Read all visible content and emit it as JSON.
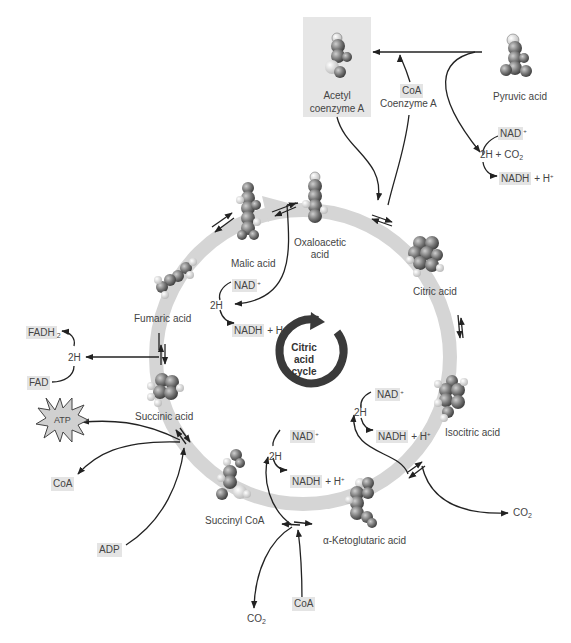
{
  "title": "Citric acid cycle",
  "colors": {
    "ring": "#d5d5d5",
    "center_ring": "#3a3a3a",
    "chip_bg": "#e4e4e4",
    "acetyl_box": "#e6e6e6",
    "arrow": "#222222",
    "text": "#444444"
  },
  "center": {
    "line1": "Citric",
    "line2": "acid",
    "line3": "cycle"
  },
  "molecules": {
    "pyruvic": "Pyruvic acid",
    "acetyl_l1": "Acetyl",
    "acetyl_l2": "coenzyme A",
    "oxaloacetic_l1": "Oxaloacetic",
    "oxaloacetic_l2": "acid",
    "citric": "Citric acid",
    "isocitric": "Isocitric acid",
    "ketoglutaric": "α-Ketoglutaric acid",
    "succinyl": "Succinyl CoA",
    "succinic": "Succinic acid",
    "fumaric": "Fumaric acid",
    "malic": "Malic acid"
  },
  "cofactors": {
    "coa_chip": "CoA",
    "coenzyme_a": "Coenzyme A",
    "pyr_nad": "NAD",
    "pyr_2h_co2": "2H + CO",
    "pyr_nadh": "NADH",
    "pyr_h": "+ H",
    "mal_nad": "NAD",
    "mal_2h": "2H",
    "mal_nadh": "NADH",
    "mal_h": "+ H",
    "fadh2": "FADH",
    "fum_2h": "2H",
    "fad": "FAD",
    "atp": "ATP",
    "coa_left": "CoA",
    "adp": "ADP",
    "iso_nad": "NAD",
    "iso_2h": "2H",
    "iso_nadh": "NADH",
    "iso_h": "+ H",
    "iso_co2": "CO",
    "kg_nad": "NAD",
    "kg_2h": "2H",
    "kg_nadh": "NADH",
    "kg_h": "+ H",
    "kg_co2": "CO",
    "kg_coa": "CoA"
  },
  "glyphs": {
    "plus_sup": "+",
    "two_sub": "2"
  }
}
